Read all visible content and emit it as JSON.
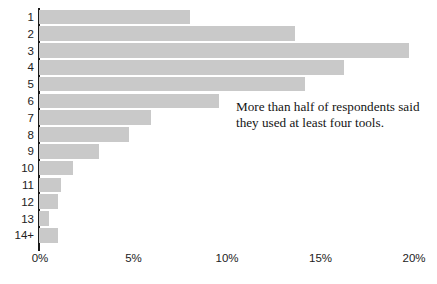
{
  "chart_data": {
    "type": "bar",
    "orientation": "horizontal",
    "title": "",
    "subtitle": "",
    "xlabel": "",
    "ylabel": "",
    "categories": [
      "1",
      "2",
      "3",
      "4",
      "5",
      "6",
      "7",
      "8",
      "9",
      "10",
      "11",
      "12",
      "13",
      "14+"
    ],
    "values": [
      8.1,
      13.7,
      19.8,
      16.3,
      14.2,
      9.6,
      6.0,
      4.8,
      3.2,
      1.8,
      1.2,
      1.0,
      0.55,
      1.0
    ],
    "value_suffix": "%",
    "xlim": [
      0,
      20
    ],
    "xticks": [
      0,
      5,
      10,
      15,
      20
    ],
    "xtick_labels": [
      "0%",
      "5%",
      "10%",
      "15%",
      "20%"
    ],
    "grid": false,
    "legend": null,
    "bar_color": "#c9c9c9",
    "axis_color": "#1a1a1a",
    "annotations": [
      {
        "text": "More than half of respondents said they used at least four tools."
      }
    ]
  }
}
